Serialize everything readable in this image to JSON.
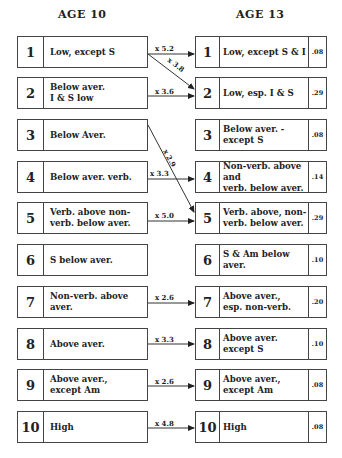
{
  "headers": {
    "left": "AGE 10",
    "right": "AGE 13"
  },
  "left_boxes": [
    {
      "num": "1",
      "label": "Low, except S"
    },
    {
      "num": "2",
      "label": "Below aver.\nI & S low"
    },
    {
      "num": "3",
      "label": "Below Aver."
    },
    {
      "num": "4",
      "label": "Below aver. verb."
    },
    {
      "num": "5",
      "label": "Verb. above non-\nverb. below aver."
    },
    {
      "num": "6",
      "label": "S below aver."
    },
    {
      "num": "7",
      "label": "Non-verb. above\naver."
    },
    {
      "num": "8",
      "label": "Above aver."
    },
    {
      "num": "9",
      "label": "Above aver.,\nexcept Am"
    },
    {
      "num": "10",
      "label": "High"
    }
  ],
  "right_boxes": [
    {
      "num": "1",
      "label": "Low, except S & I",
      "value": ".08"
    },
    {
      "num": "2",
      "label": "Low, esp. I & S",
      "value": ".29"
    },
    {
      "num": "3",
      "label": "Below aver. -\nexcept S",
      "value": ".08"
    },
    {
      "num": "4",
      "label": "Non-verb. above and\nverb. below aver.",
      "value": ".14"
    },
    {
      "num": "5",
      "label": "Verb. above, non-\nverb. below aver.",
      "value": ".29"
    },
    {
      "num": "6",
      "label": "S & Am below aver.",
      "value": ".10"
    },
    {
      "num": "7",
      "label": "Above aver.,\nesp. non-verb.",
      "value": ".20"
    },
    {
      "num": "8",
      "label": "Above aver.\nexcept S",
      "value": ".10"
    },
    {
      "num": "9",
      "label": "Above aver.,\nexcept Am",
      "value": ".08"
    },
    {
      "num": "10",
      "label": "High",
      "value": ".08"
    }
  ],
  "arrows": [
    {
      "from": "1",
      "to": "1",
      "label": "x 5.2"
    },
    {
      "from": "1",
      "to": "2",
      "label": "x 3.8"
    },
    {
      "from": "2",
      "to": "2",
      "label": "x 3.6"
    },
    {
      "from": "3",
      "to": "5",
      "label": "x 2.9"
    },
    {
      "from": "4",
      "to": "4",
      "label": "x 3.3"
    },
    {
      "from": "5",
      "to": "5",
      "label": "x 5.0"
    },
    {
      "from": "7",
      "to": "7",
      "label": "x 2.6"
    },
    {
      "from": "8",
      "to": "8",
      "label": "x 3.3"
    },
    {
      "from": "9",
      "to": "9",
      "label": "x 2.6"
    },
    {
      "from": "10",
      "to": "10",
      "label": "x 4.8"
    }
  ]
}
